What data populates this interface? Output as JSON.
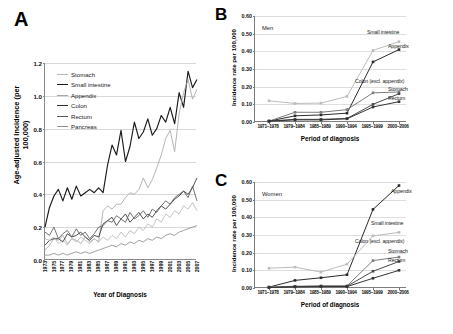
{
  "figure": {
    "panels": [
      {
        "letter": "A"
      },
      {
        "letter": "B"
      },
      {
        "letter": "C"
      }
    ]
  },
  "panel_a": {
    "letter": "A",
    "ylabel": "Age-adjusted Incidence (per 100,000)",
    "xlabel": "Year of Diagnosis",
    "legend": [
      {
        "label": "Stomach",
        "color": "#b9b9b9",
        "width": 1.1
      },
      {
        "label": "Small intestine",
        "color": "#1a1a1a",
        "width": 1.6
      },
      {
        "label": "Appendix",
        "color": "#a8a8a8",
        "width": 1.1
      },
      {
        "label": "Colon",
        "color": "#303030",
        "width": 1.5
      },
      {
        "label": "Rectum",
        "color": "#5a5a5a",
        "width": 1.1
      },
      {
        "label": "Pancreas",
        "color": "#8f8f8f",
        "width": 1.1
      }
    ]
  },
  "panel_b": {
    "letter": "B",
    "sex": "Men",
    "ylabel": "Incidence rate per 100,000",
    "xlabel": "Period of diagnosis"
  },
  "panel_c": {
    "letter": "C",
    "sex": "Women",
    "ylabel": "Incidence rate per 100,000",
    "xlabel": "Period of diagnosis"
  },
  "chart_data": [
    {
      "panel": "A",
      "type": "line",
      "title": "",
      "xlabel": "Year of Diagnosis",
      "ylabel": "Age-adjusted Incidence (per 100,000)",
      "ylim": [
        0.0,
        1.2
      ],
      "yticks": [
        "0.0",
        "0.2",
        "0.4",
        "0.6",
        "0.8",
        "1.0",
        "1.2"
      ],
      "grid": true,
      "legend_position": "upper-left",
      "x": [
        1973,
        1974,
        1975,
        1976,
        1977,
        1978,
        1979,
        1980,
        1981,
        1982,
        1983,
        1984,
        1985,
        1986,
        1987,
        1988,
        1989,
        1990,
        1991,
        1992,
        1993,
        1994,
        1995,
        1996,
        1997,
        1998,
        1999,
        2000,
        2001,
        2002,
        2003,
        2004,
        2005,
        2006,
        2007
      ],
      "xtick_labels": [
        "1973",
        "1975",
        "1977",
        "1979",
        "1981",
        "1983",
        "1985",
        "1987",
        "1989",
        "1991",
        "1993",
        "1995",
        "1997",
        "1999",
        "2001",
        "2003",
        "2005",
        "2007"
      ],
      "series": [
        {
          "name": "Small intestine",
          "color": "#1a1a1a",
          "values": [
            0.2,
            0.32,
            0.39,
            0.43,
            0.36,
            0.44,
            0.37,
            0.45,
            0.39,
            0.41,
            0.43,
            0.41,
            0.44,
            0.41,
            0.58,
            0.7,
            0.64,
            0.79,
            0.6,
            0.69,
            0.84,
            0.74,
            0.78,
            0.86,
            0.76,
            0.8,
            0.88,
            0.84,
            0.93,
            0.83,
            1.02,
            0.93,
            1.15,
            1.05,
            1.1
          ]
        },
        {
          "name": "Appendix",
          "color": "#a8a8a8",
          "values": [
            0.06,
            0.09,
            0.13,
            0.12,
            0.15,
            0.1,
            0.13,
            0.12,
            0.1,
            0.14,
            0.11,
            0.13,
            0.11,
            0.3,
            0.33,
            0.31,
            0.34,
            0.34,
            0.38,
            0.41,
            0.4,
            0.43,
            0.5,
            0.44,
            0.49,
            0.56,
            0.64,
            0.74,
            0.79,
            0.66,
            0.89,
            1.02,
            1.1,
            0.98,
            1.04
          ]
        },
        {
          "name": "Colon",
          "color": "#303030",
          "values": [
            0.09,
            0.12,
            0.13,
            0.13,
            0.11,
            0.16,
            0.14,
            0.15,
            0.17,
            0.14,
            0.12,
            0.15,
            0.14,
            0.22,
            0.24,
            0.26,
            0.21,
            0.25,
            0.28,
            0.23,
            0.26,
            0.29,
            0.25,
            0.28,
            0.26,
            0.3,
            0.33,
            0.31,
            0.34,
            0.37,
            0.39,
            0.42,
            0.4,
            0.44,
            0.5
          ]
        },
        {
          "name": "Rectum",
          "color": "#5a5a5a",
          "values": [
            0.17,
            0.15,
            0.2,
            0.13,
            0.16,
            0.18,
            0.14,
            0.19,
            0.15,
            0.17,
            0.13,
            0.16,
            0.2,
            0.21,
            0.24,
            0.23,
            0.27,
            0.25,
            0.23,
            0.29,
            0.25,
            0.27,
            0.3,
            0.26,
            0.31,
            0.29,
            0.33,
            0.36,
            0.34,
            0.38,
            0.4,
            0.42,
            0.38,
            0.45,
            0.36
          ]
        },
        {
          "name": "Stomach",
          "color": "#b9b9b9",
          "values": [
            0.13,
            0.12,
            0.14,
            0.1,
            0.12,
            0.09,
            0.13,
            0.11,
            0.14,
            0.12,
            0.1,
            0.13,
            0.11,
            0.14,
            0.12,
            0.15,
            0.13,
            0.17,
            0.14,
            0.18,
            0.16,
            0.2,
            0.18,
            0.22,
            0.2,
            0.25,
            0.23,
            0.28,
            0.26,
            0.3,
            0.28,
            0.33,
            0.31,
            0.35,
            0.3
          ]
        },
        {
          "name": "Pancreas",
          "color": "#8f8f8f",
          "values": [
            0.03,
            0.03,
            0.04,
            0.03,
            0.04,
            0.03,
            0.04,
            0.05,
            0.04,
            0.05,
            0.04,
            0.05,
            0.06,
            0.07,
            0.08,
            0.09,
            0.08,
            0.1,
            0.09,
            0.11,
            0.1,
            0.12,
            0.11,
            0.13,
            0.12,
            0.14,
            0.13,
            0.15,
            0.16,
            0.15,
            0.17,
            0.18,
            0.19,
            0.2,
            0.21
          ]
        }
      ]
    },
    {
      "panel": "B",
      "type": "line",
      "title": "Men",
      "xlabel": "Period of diagnosis",
      "ylabel": "Incidence rate per 100,000",
      "ylim": [
        0.0,
        0.6
      ],
      "yticks": [
        "0.00",
        "0.10",
        "0.20",
        "0.30",
        "0.40",
        "0.50",
        "0.60"
      ],
      "grid": true,
      "categories": [
        "1971–1978",
        "1979–1984",
        "1985–1989",
        "1990–1994",
        "1995–1999",
        "2000–2006"
      ],
      "series": [
        {
          "name": "Small intestine",
          "color": "#bcbcbc",
          "values": [
            0.12,
            0.105,
            0.107,
            0.145,
            0.405,
            0.455
          ]
        },
        {
          "name": "Appendix",
          "color": "#2b2b2b",
          "values": [
            0.005,
            0.035,
            0.04,
            0.05,
            0.34,
            0.41
          ]
        },
        {
          "name": "Colon (excl. appendix)",
          "color": "#7d7d7d",
          "values": [
            0.005,
            0.055,
            0.055,
            0.07,
            0.165,
            0.17
          ]
        },
        {
          "name": "Stomach",
          "color": "#4a4a4a",
          "values": [
            0.005,
            0.015,
            0.015,
            0.02,
            0.1,
            0.16
          ]
        },
        {
          "name": "Rectum",
          "color": "#333333",
          "values": [
            0.005,
            0.012,
            0.012,
            0.018,
            0.085,
            0.115
          ]
        }
      ]
    },
    {
      "panel": "C",
      "type": "line",
      "title": "Women",
      "xlabel": "Period of diagnosis",
      "ylabel": "Incidence rate per 100,000",
      "ylim": [
        0.0,
        0.6
      ],
      "yticks": [
        "0.00",
        "0.10",
        "0.20",
        "0.30",
        "0.40",
        "0.50",
        "0.60"
      ],
      "grid": true,
      "categories": [
        "1971–1978",
        "1979–1984",
        "1985–1989",
        "1990–1994",
        "1995–1999",
        "2000–2006"
      ],
      "series": [
        {
          "name": "Appendix",
          "color": "#2b2b2b",
          "values": [
            0.005,
            0.043,
            0.058,
            0.075,
            0.445,
            0.58
          ]
        },
        {
          "name": "Small intestine",
          "color": "#bcbcbc",
          "values": [
            0.112,
            0.118,
            0.09,
            0.135,
            0.295,
            0.315
          ]
        },
        {
          "name": "Colon (excl. appendix)",
          "color": "#7d7d7d",
          "values": [
            0.005,
            0.01,
            0.012,
            0.012,
            0.155,
            0.175
          ]
        },
        {
          "name": "Stomach",
          "color": "#4a4a4a",
          "values": [
            0.004,
            0.008,
            0.01,
            0.01,
            0.095,
            0.15
          ]
        },
        {
          "name": "Rectum",
          "color": "#333333",
          "values": [
            0.003,
            0.006,
            0.008,
            0.008,
            0.055,
            0.1
          ]
        }
      ]
    }
  ]
}
